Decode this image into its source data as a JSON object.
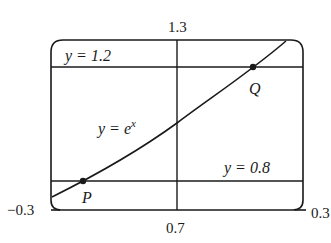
{
  "diagram": {
    "window": {
      "x_min_label": "−0.3",
      "x_max_label": "0.3",
      "y_min_label": "0.7",
      "y_max_label": "1.3"
    },
    "curve_label": {
      "base": "y = e",
      "exponent": "x"
    },
    "lines": [
      {
        "label": "y = 1.2",
        "value": 1.2
      },
      {
        "label": "y = 0.8",
        "value": 0.8
      }
    ],
    "points": [
      {
        "label": "P",
        "description": "intersection of y = e^x and y = 0.8"
      },
      {
        "label": "Q",
        "description": "intersection of y = e^x and y = 1.2"
      }
    ],
    "colors": {
      "ink": "#1a1a1a",
      "background": "#ffffff"
    }
  }
}
